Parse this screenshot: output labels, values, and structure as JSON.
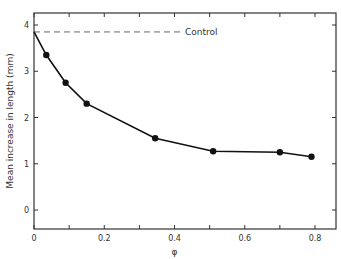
{
  "chart_data": {
    "type": "line",
    "title": "",
    "xlabel": "φ",
    "ylabel": "Mean increase in length (mm)",
    "xlim": [
      0,
      0.85
    ],
    "ylim": [
      -0.4,
      4.3
    ],
    "x_ticks": [
      "0",
      "0.2",
      "0.4",
      "0.6",
      "0.8"
    ],
    "y_ticks": [
      "0",
      "1",
      "2",
      "3",
      "4"
    ],
    "grid": false,
    "series": [
      {
        "name": "Mean increase",
        "x": [
          0,
          0.035,
          0.09,
          0.15,
          0.345,
          0.51,
          0.7,
          0.79
        ],
        "y": [
          3.85,
          3.35,
          2.75,
          2.3,
          1.55,
          1.27,
          1.25,
          1.15
        ],
        "markers": [
          false,
          true,
          true,
          true,
          true,
          true,
          true,
          true
        ]
      }
    ],
    "reference_lines": [
      {
        "name": "Control",
        "y": 3.85,
        "style": "dashed",
        "label_x": 0.43
      }
    ],
    "annotations": [
      "Control"
    ]
  }
}
